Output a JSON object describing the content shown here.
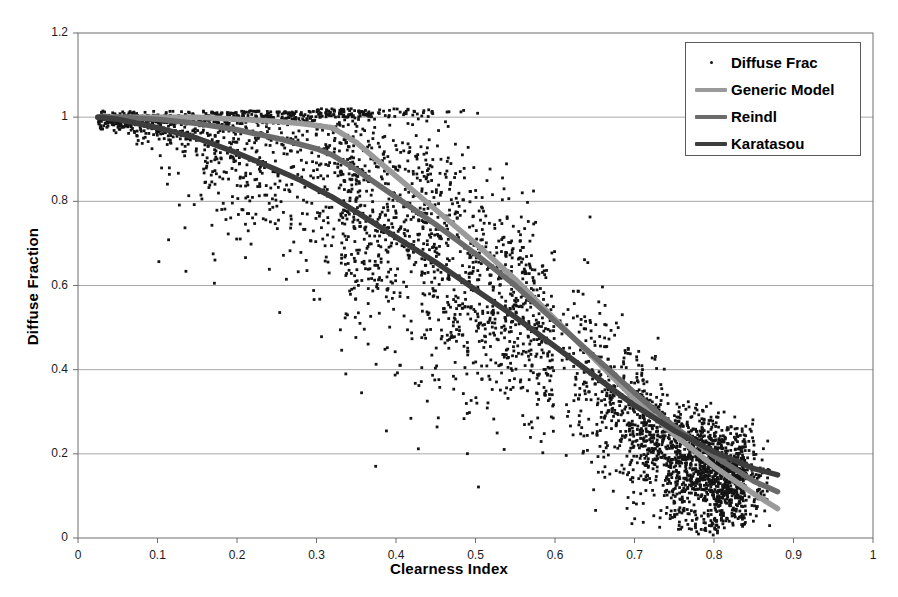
{
  "chart_data": {
    "type": "scatter",
    "title": "",
    "xlabel": "Clearness Index",
    "ylabel": "Diffuse Fraction",
    "xlim": [
      0,
      1
    ],
    "ylim": [
      0,
      1.2
    ],
    "xticks": [
      "0",
      "0.1",
      "0.2",
      "0.3",
      "0.4",
      "0.5",
      "0.6",
      "0.7",
      "0.8",
      "0.9",
      "1"
    ],
    "yticks": [
      "0",
      "0.2",
      "0.4",
      "0.6",
      "0.8",
      "1",
      "1.2"
    ],
    "grid": "horizontal",
    "legend_position": "top-right",
    "series": [
      {
        "name": "Diffuse Frac",
        "type": "scatter",
        "marker": "dot",
        "color": "#141414",
        "description": "Measured hourly diffuse fraction versus clearness index; dense band from kt=0.025 at Fd~1.0 falling to kt~0.85 at Fd~0.1, with wide vertical spread between kt=0.35 and kt=0.65."
      },
      {
        "name": "Generic Model",
        "type": "line",
        "color": "#9a9a9a",
        "x": [
          0.025,
          0.05,
          0.1,
          0.15,
          0.2,
          0.25,
          0.28,
          0.3,
          0.32,
          0.35,
          0.4,
          0.45,
          0.5,
          0.55,
          0.6,
          0.65,
          0.7,
          0.75,
          0.8,
          0.85,
          0.88
        ],
        "y": [
          1.0,
          1.0,
          1.0,
          1.0,
          0.995,
          0.99,
          0.985,
          0.98,
          0.975,
          0.94,
          0.86,
          0.78,
          0.7,
          0.615,
          0.52,
          0.425,
          0.33,
          0.245,
          0.17,
          0.105,
          0.07
        ]
      },
      {
        "name": "Reindl",
        "type": "line",
        "color": "#6b6b6b",
        "x": [
          0.025,
          0.05,
          0.1,
          0.15,
          0.2,
          0.25,
          0.28,
          0.3,
          0.32,
          0.35,
          0.4,
          0.45,
          0.5,
          0.55,
          0.6,
          0.65,
          0.7,
          0.75,
          0.8,
          0.85,
          0.88
        ],
        "y": [
          1.0,
          1.0,
          0.995,
          0.985,
          0.97,
          0.95,
          0.935,
          0.925,
          0.91,
          0.875,
          0.81,
          0.745,
          0.675,
          0.6,
          0.515,
          0.43,
          0.345,
          0.265,
          0.195,
          0.135,
          0.11
        ]
      },
      {
        "name": "Karatasou",
        "type": "line",
        "color": "#3d3d3d",
        "x": [
          0.025,
          0.05,
          0.1,
          0.15,
          0.2,
          0.25,
          0.28,
          0.3,
          0.32,
          0.35,
          0.4,
          0.45,
          0.5,
          0.55,
          0.6,
          0.65,
          0.7,
          0.75,
          0.8,
          0.85,
          0.88
        ],
        "y": [
          1.0,
          0.995,
          0.975,
          0.95,
          0.915,
          0.875,
          0.85,
          0.83,
          0.81,
          0.775,
          0.715,
          0.655,
          0.59,
          0.525,
          0.455,
          0.385,
          0.315,
          0.255,
          0.205,
          0.165,
          0.15
        ]
      }
    ]
  },
  "legend": {
    "items": [
      {
        "label": "Diffuse Frac",
        "key": "dot",
        "color": "#141414"
      },
      {
        "label": "Generic Model",
        "key": "line",
        "color": "#9a9a9a"
      },
      {
        "label": "Reindl",
        "key": "line",
        "color": "#6b6b6b"
      },
      {
        "label": "Karatasou",
        "key": "line",
        "color": "#3d3d3d"
      }
    ]
  },
  "axes": {
    "x_title": "Clearness Index",
    "y_title": "Diffuse Fraction"
  }
}
